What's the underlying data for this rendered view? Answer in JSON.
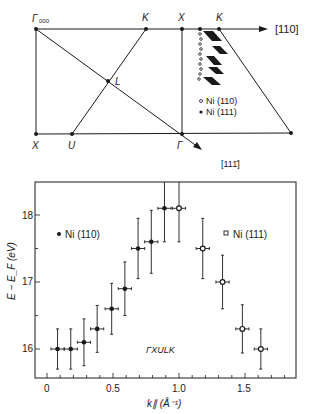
{
  "diagram": {
    "points": {
      "gamma000": "Γ",
      "gamma000_sub": "000",
      "K1": "K",
      "X1": "X",
      "K2": "K",
      "L": "L",
      "X2": "X",
      "U": "U",
      "gamma": "Γ"
    },
    "direction_110": "[110]",
    "direction_11m1": "[111̄]",
    "legend": [
      {
        "marker": "open-circle",
        "label": "Ni (110)"
      },
      {
        "marker": "filled-circle",
        "label": "Ni (111)"
      }
    ]
  },
  "chart_data": {
    "type": "scatter",
    "title": "",
    "xlabel": "k∥ (Å⁻¹)",
    "ylabel": "E − E_F (eV)",
    "xlim": [
      -0.1,
      1.88
    ],
    "ylim": [
      15.65,
      18.5
    ],
    "xticks": [
      "0",
      "0.5",
      "1.0",
      "1.5"
    ],
    "yticks": [
      "16",
      "17",
      "18"
    ],
    "annotation": "ΓXULK",
    "grid": false,
    "series": [
      {
        "name": "Ni (110)",
        "marker": "filled-circle",
        "x": [
          0.08,
          0.18,
          0.28,
          0.38,
          0.49,
          0.59,
          0.69,
          0.79,
          0.89
        ],
        "y": [
          16.0,
          16.0,
          16.1,
          16.3,
          16.6,
          16.9,
          17.5,
          17.6,
          18.1
        ],
        "yerr": [
          0.3,
          0.3,
          0.35,
          0.35,
          0.38,
          0.4,
          0.45,
          0.47,
          0.5
        ],
        "xerr": 0.05
      },
      {
        "name": "Ni (111)",
        "marker": "open-square",
        "x": [
          1.0,
          1.18,
          1.33,
          1.48,
          1.62
        ],
        "y": [
          18.1,
          17.5,
          17.0,
          16.3,
          16.0
        ],
        "yerr": [
          0.5,
          0.45,
          0.4,
          0.36,
          0.3
        ],
        "xerr": 0.05
      }
    ],
    "legend": [
      {
        "label": "Ni (110)",
        "marker": "filled-circle",
        "position": "upper-left"
      },
      {
        "label": "Ni (111)",
        "marker": "open-square",
        "position": "upper-right"
      }
    ]
  }
}
